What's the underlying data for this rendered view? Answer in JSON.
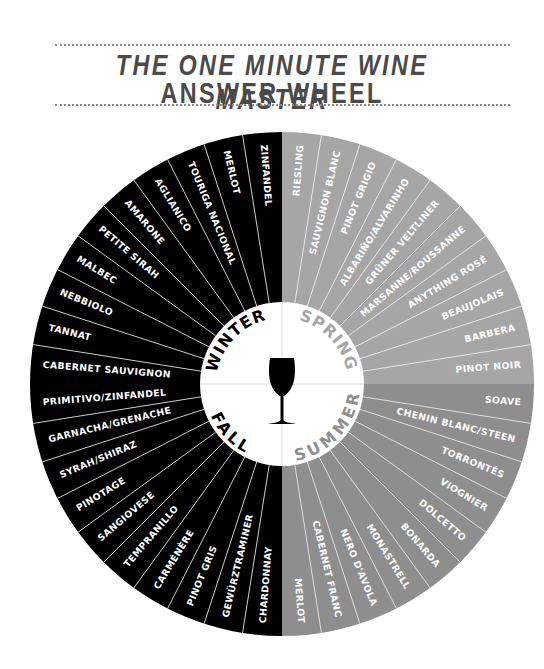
{
  "header": {
    "title_line1": "THE ONE MINUTE WINE MASTER",
    "title_line2": "ANSWER WHEEL"
  },
  "wheel": {
    "center_icon": "wine-glass-icon",
    "colors": {
      "winter": "#000000",
      "fall": "#000000",
      "spring": "#a6a6a6",
      "summer": "#8e8e8e",
      "center": "#ffffff",
      "winter_label": "#000000",
      "fall_label": "#000000",
      "spring_label": "#a6a6a6",
      "summer_label": "#8e8e8e"
    },
    "seasons": [
      {
        "name": "WINTER",
        "wines": [
          "CABERNET SAUVIGNON",
          "TANNAT",
          "NEBBIOLO",
          "MALBEC",
          "PETITE SIRAH",
          "AMARONE",
          "AGLIANICO",
          "TOURIGA NACIONAL",
          "MERLOT",
          "ZINFANDEL"
        ]
      },
      {
        "name": "SPRING",
        "wines": [
          "RIESLING",
          "SAUVIGNON BLANC",
          "PINOT GRIGIO",
          "ALBARIÑO/ALVARINHO",
          "GRÜNER VELTLINER",
          "MARSANNE/ROUSSANNE",
          "ANYTHING ROSÉ",
          "BEAUJOLAIS",
          "BARBERA",
          "PINOT NOIR"
        ]
      },
      {
        "name": "SUMMER",
        "wines": [
          "SOAVE",
          "CHENIN BLANC/STEEN",
          "TORRONTÉS",
          "VIOGNIER",
          "DOLCETTO",
          "BONARDA",
          "MONASTRELL",
          "NERO D'AVOLA",
          "CABERNET FRANC",
          "MERLOT"
        ]
      },
      {
        "name": "FALL",
        "wines": [
          "CHARDONNAY",
          "GEWÜRZTRAMINER",
          "PINOT GRIS",
          "CARMÉNÈRE",
          "TEMPRANILLO",
          "SANGIOVESE",
          "PINOTAGE",
          "SYRAH/SHIRAZ",
          "GARNACHA/GRENACHE",
          "PRIMITIVO/ZINFANDEL"
        ]
      }
    ]
  }
}
